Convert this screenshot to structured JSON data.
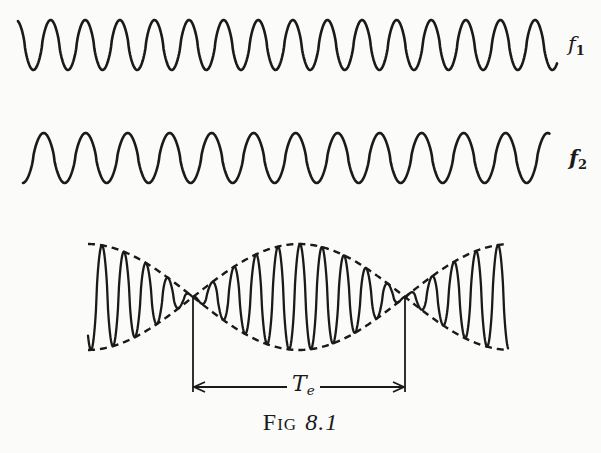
{
  "figure": {
    "caption_prefix": "Fig",
    "caption_number": "8.1",
    "labels": {
      "f1_main": "f",
      "f1_sub": "1",
      "f2_main": "f",
      "f2_sub": "2",
      "te_main": "T",
      "te_sub": "e"
    },
    "waves": [
      {
        "name": "f1",
        "x_start": 18,
        "x_end": 557,
        "y_center": 45,
        "amplitude": 25,
        "period": 34.6,
        "phase_start": "peak-descending"
      },
      {
        "name": "f2",
        "x_start": 23,
        "x_end": 550,
        "y_center": 158,
        "amplitude": 25,
        "period": 42.0,
        "phase_start": "trough-rising"
      }
    ],
    "beat": {
      "description": "Superposition of f1 and f2 showing beats with dashed amplitude envelope",
      "x_start": 88,
      "x_end": 508,
      "y_center": 297,
      "max_amplitude": 53,
      "nodes_x": [
        193,
        405
      ],
      "antinodes_x": [
        88,
        300,
        508
      ],
      "envelope_style": "dashed"
    },
    "period_marker": {
      "label": "Te",
      "x_left": 193,
      "x_right": 405,
      "arrow_y": 387
    },
    "colors": {
      "ink": "#1a1a1a",
      "paper": "#fbfbf9"
    }
  }
}
